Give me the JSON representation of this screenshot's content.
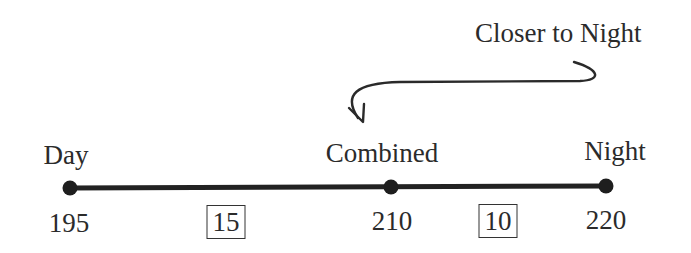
{
  "diagram": {
    "type": "number-line",
    "annotation": {
      "text": "Closer to Night",
      "points_to": "Combined"
    },
    "points": [
      {
        "label": "Day",
        "value": "195"
      },
      {
        "label": "Combined",
        "value": "210"
      },
      {
        "label": "Night",
        "value": "220"
      }
    ],
    "differences": [
      {
        "between": [
          "Day",
          "Combined"
        ],
        "value": "15"
      },
      {
        "between": [
          "Combined",
          "Night"
        ],
        "value": "10"
      }
    ],
    "colors": {
      "line": "#222222",
      "text": "#2b2b2b"
    }
  }
}
